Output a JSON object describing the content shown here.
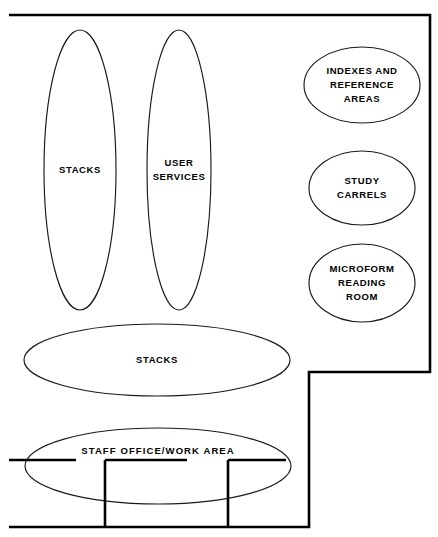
{
  "diagram": {
    "type": "floor-plan-bubble-diagram",
    "background_color": "#ffffff",
    "line_color": "#000000",
    "ellipse_stroke_color": "#1a1a1a",
    "canvas": {
      "width": 438,
      "height": 537
    }
  },
  "outline": {
    "name": "building-perimeter",
    "shape": "L-shaped polygon",
    "points": "9,15 430,15 430,372 309,372 309,527 9,527",
    "stroke_width": 2.6
  },
  "zones": [
    {
      "id": "stacks-left",
      "name": "stacks-vertical-left",
      "label": "STACKS",
      "lines": [
        "STACKS"
      ],
      "shape": "ellipse",
      "cx": 80,
      "cy": 170,
      "rx": 36,
      "ry": 140
    },
    {
      "id": "user-services",
      "name": "user-services",
      "label": "USER SERVICES",
      "lines": [
        "USER",
        "SERVICES"
      ],
      "shape": "ellipse",
      "cx": 179,
      "cy": 170,
      "rx": 32,
      "ry": 140
    },
    {
      "id": "indexes-reference",
      "name": "indexes-and-reference-areas",
      "label": "INDEXES AND REFERENCE AREAS",
      "lines": [
        "INDEXES AND",
        "REFERENCE",
        "AREAS"
      ],
      "shape": "ellipse",
      "cx": 362,
      "cy": 85,
      "rx": 58,
      "ry": 38
    },
    {
      "id": "study-carrels",
      "name": "study-carrels",
      "label": "STUDY CARRELS",
      "lines": [
        "STUDY",
        "CARRELS"
      ],
      "shape": "ellipse",
      "cx": 362,
      "cy": 188,
      "rx": 53,
      "ry": 37
    },
    {
      "id": "microform-reading-room",
      "name": "microform-reading-room",
      "label": "MICROFORM READING ROOM",
      "lines": [
        "MICROFORM",
        "READING",
        "ROOM"
      ],
      "shape": "ellipse",
      "cx": 362,
      "cy": 283,
      "rx": 53,
      "ry": 39
    },
    {
      "id": "stacks-lower",
      "name": "stacks-horizontal-lower",
      "label": "STACKS",
      "lines": [
        "STACKS"
      ],
      "shape": "ellipse",
      "cx": 157,
      "cy": 360,
      "rx": 133,
      "ry": 36
    },
    {
      "id": "staff-office",
      "name": "staff-office-work-area",
      "label": "STAFF OFFICE/WORK AREA",
      "lines": [
        "STAFF OFFICE/WORK AREA"
      ],
      "shape": "ellipse",
      "cx": 158,
      "cy": 466,
      "rx": 133,
      "ry": 38
    }
  ],
  "interior_walls": [
    {
      "name": "wall-segment-left",
      "description": "horizontal wall from left perimeter",
      "path": "M 9 460 L 76 460"
    },
    {
      "name": "wall-segment-center",
      "description": "horizontal wall middle bay",
      "path": "M 105 460 L 187 460"
    },
    {
      "name": "wall-segment-right",
      "description": "horizontal wall right bay",
      "path": "M 228 460 L 286 460"
    },
    {
      "name": "partition-wall-1",
      "description": "vertical partition between left and center bays",
      "path": "M 105 460 L 105 527"
    },
    {
      "name": "partition-wall-2",
      "description": "vertical partition between center and right bays",
      "path": "M 228 460 L 228 527"
    }
  ]
}
